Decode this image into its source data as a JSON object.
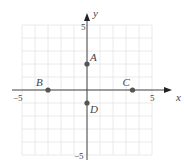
{
  "chart_data": {
    "type": "scatter",
    "title": "",
    "xlabel": "x",
    "ylabel": "y",
    "xlim": [
      -5,
      5
    ],
    "ylim": [
      -5,
      5
    ],
    "grid": true,
    "tick_labels": {
      "x_min": "−5",
      "x_max": "5",
      "y_min": "−5",
      "y_max": "5"
    },
    "points": [
      {
        "label": "A",
        "x": 0,
        "y": 2
      },
      {
        "label": "B",
        "x": -3,
        "y": 0
      },
      {
        "label": "C",
        "x": 3.5,
        "y": 0
      },
      {
        "label": "D",
        "x": 0,
        "y": -1
      }
    ]
  },
  "colors": {
    "axis": "#444444",
    "grid": "#e4e4e4",
    "point": "#555555"
  }
}
